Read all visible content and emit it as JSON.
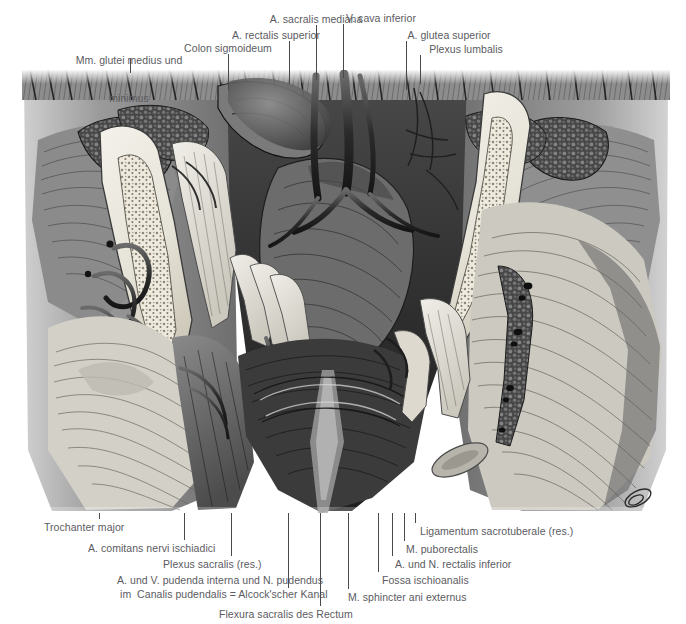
{
  "figure": {
    "kind": "anatomical-illustration",
    "language": "de",
    "rendering": "grayscale halftone engraving",
    "text_color": "#5b5b5f",
    "leader_color": "#4a4a4e",
    "background": "#ffffff",
    "image_box": {
      "x": 22,
      "y": 70,
      "width": 648,
      "height": 443
    }
  },
  "labels_top": [
    {
      "id": "mm-glutei-medius-und-minimus",
      "line1": "Mm. glutei medius und",
      "line2": "minimus",
      "x": 129,
      "y": 29,
      "align": "c",
      "leader": {
        "x": 130,
        "y1": 59,
        "y2": 73
      }
    },
    {
      "id": "colon-sigmoideum",
      "line1": "Colon sigmoideum",
      "line2": "",
      "x": 228,
      "y": 42,
      "align": "c",
      "leader": {
        "x": 228,
        "y1": 54,
        "y2": 90
      }
    },
    {
      "id": "a-rectalis-superior",
      "line1": "A. rectalis superior",
      "line2": "",
      "x": 276,
      "y": 29,
      "align": "c",
      "leader": {
        "x": 289,
        "y1": 41,
        "y2": 84
      }
    },
    {
      "id": "a-sacralis-mediana",
      "line1": "A. sacralis mediana",
      "line2": "",
      "x": 316,
      "y": 13,
      "align": "c",
      "leader": {
        "x": 316,
        "y1": 25,
        "y2": 80
      }
    },
    {
      "id": "v-cava-inferior",
      "line1": "V. cava inferior",
      "line2": "",
      "x": 381,
      "y": 12,
      "align": "c",
      "leader": {
        "x": 343,
        "y1": 24,
        "y2": 78
      }
    },
    {
      "id": "a-glutea-superior",
      "line1": "A. glutea superior",
      "line2": "",
      "x": 449,
      "y": 29,
      "align": "c",
      "leader": {
        "x": 406,
        "y1": 41,
        "y2": 90
      }
    },
    {
      "id": "plexus-lumbalis",
      "line1": "Plexus lumbalis",
      "line2": "",
      "x": 466,
      "y": 43,
      "align": "c",
      "leader": {
        "x": 420,
        "y1": 55,
        "y2": 84
      }
    }
  ],
  "labels_bottom": [
    {
      "id": "trochanter-major",
      "text": "Trochanter major",
      "x": 44,
      "y": 521,
      "align": "l",
      "leader": {
        "x": 99,
        "y1": 513,
        "y2": 519
      }
    },
    {
      "id": "a-comitans-nervi-ischiadici",
      "text": "A. comitans nervi ischiadici",
      "x": 88,
      "y": 542,
      "align": "l",
      "leader": {
        "x": 184,
        "y1": 513,
        "y2": 540
      }
    },
    {
      "id": "plexus-sacralis-res",
      "text": "Plexus sacralis (res.)",
      "x": 163,
      "y": 558,
      "align": "l",
      "leader": {
        "x": 231,
        "y1": 513,
        "y2": 556
      }
    },
    {
      "id": "a-und-v-pudenda-interna-und-n-pudendus",
      "text": "A. und V. pudenda interna und N. pudendus",
      "x": 117,
      "y": 574,
      "align": "l",
      "leader": {
        "x": 288,
        "y1": 513,
        "y2": 588
      }
    },
    {
      "id": "im-canalis-pudendalis-alcockscher-kanal",
      "text": "im  Canalis pudendalis = Alcock'scher Kanal",
      "x": 120,
      "y": 588,
      "align": "l",
      "leader": null
    },
    {
      "id": "flexura-sacralis-des-rectum",
      "text": "Flexura sacralis des Rectum",
      "x": 219,
      "y": 608,
      "align": "l",
      "leader": {
        "x": 320,
        "y1": 513,
        "y2": 606
      }
    },
    {
      "id": "m-sphincter-ani-externus",
      "text": "M. sphincter ani externus",
      "x": 348,
      "y": 591,
      "align": "l",
      "leader": {
        "x": 348,
        "y1": 513,
        "y2": 589
      }
    },
    {
      "id": "fossa-ischioanalis",
      "text": "Fossa ischioanalis",
      "x": 382,
      "y": 574,
      "align": "l",
      "leader": {
        "x": 378,
        "y1": 513,
        "y2": 572
      }
    },
    {
      "id": "a-und-n-rectalis-inferior",
      "text": "A. und N. rectalis inferior",
      "x": 395,
      "y": 558,
      "align": "l",
      "leader": {
        "x": 392,
        "y1": 513,
        "y2": 556
      }
    },
    {
      "id": "m-puborectalis",
      "text": "M. puborectalis",
      "x": 406,
      "y": 543,
      "align": "l",
      "leader": {
        "x": 404,
        "y1": 513,
        "y2": 541
      }
    },
    {
      "id": "ligamentum-sacrotuberale-res",
      "text": "Ligamentum sacrotuberale (res.)",
      "x": 420,
      "y": 525,
      "align": "l",
      "leader": {
        "x": 415,
        "y1": 513,
        "y2": 523
      }
    }
  ]
}
